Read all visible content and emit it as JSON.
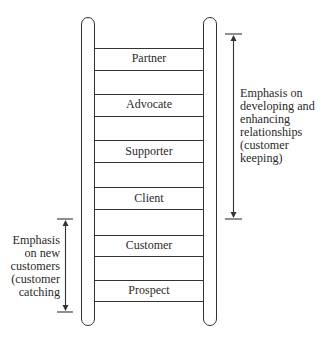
{
  "diagram": {
    "type": "ladder",
    "title": "",
    "rungs": [
      {
        "label": "Partner",
        "top": 48,
        "bottom": 70
      },
      {
        "label": "Advocate",
        "top": 94,
        "bottom": 116
      },
      {
        "label": "Supporter",
        "top": 140,
        "bottom": 162
      },
      {
        "label": "Client",
        "top": 187,
        "bottom": 209
      },
      {
        "label": "Customer",
        "top": 235,
        "bottom": 256
      },
      {
        "label": "Prospect",
        "top": 280,
        "bottom": 301
      }
    ],
    "annotations": {
      "right": {
        "lines": [
          "Emphasis on",
          "developing and",
          "enhancing",
          "relationships",
          "(customer",
          "keeping)"
        ],
        "span": [
          "Partner",
          "Client"
        ]
      },
      "left": {
        "lines": [
          "Emphasis",
          "on new",
          "customers",
          "(customer",
          "catching"
        ],
        "span": [
          "Customer",
          "Prospect"
        ]
      }
    },
    "colors": {
      "line": "#333333",
      "text": "#2a2a2a",
      "background": "#ffffff"
    }
  }
}
